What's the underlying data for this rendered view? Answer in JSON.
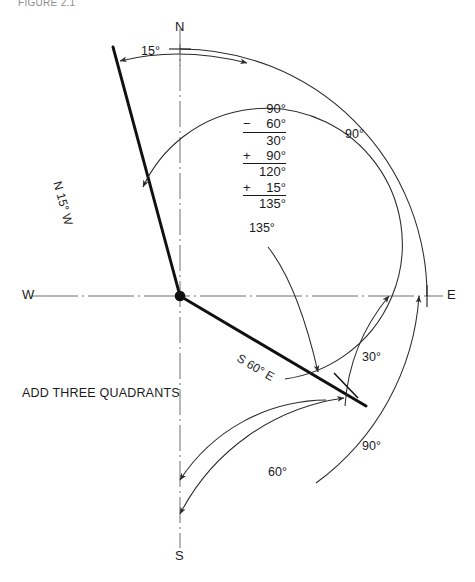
{
  "page": {
    "header_note": "FIGURE 2.1",
    "caption": "ADD THREE QUADRANTS"
  },
  "compass": {
    "north": "N",
    "south": "S",
    "east": "E",
    "west": "W"
  },
  "bearings": [
    {
      "name": "upper-left-bearing",
      "label": "N 15° W"
    },
    {
      "name": "lower-right-bearing",
      "label": "S 60° E"
    }
  ],
  "dimensions": [
    {
      "name": "angle-15",
      "label": "15°"
    },
    {
      "name": "angle-90-upper-right",
      "label": "90°"
    },
    {
      "name": "angle-135",
      "label": "135°"
    },
    {
      "name": "angle-30",
      "label": "30°"
    },
    {
      "name": "angle-60-lower",
      "label": "60°"
    },
    {
      "name": "angle-90-lower",
      "label": "90°"
    }
  ],
  "calculation": {
    "rows": [
      {
        "op": "",
        "value": "90°",
        "ruled": false
      },
      {
        "op": "−",
        "value": "60°",
        "ruled": true
      },
      {
        "op": "",
        "value": "30°",
        "ruled": false
      },
      {
        "op": "+",
        "value": "90°",
        "ruled": true
      },
      {
        "op": "",
        "value": "120°",
        "ruled": false
      },
      {
        "op": "+",
        "value": "15°",
        "ruled": true
      },
      {
        "op": "",
        "value": "135°",
        "ruled": false
      }
    ]
  },
  "colors": {
    "ink": "#1a1a1a",
    "thin": "#3a3a3a",
    "background": "#ffffff"
  }
}
